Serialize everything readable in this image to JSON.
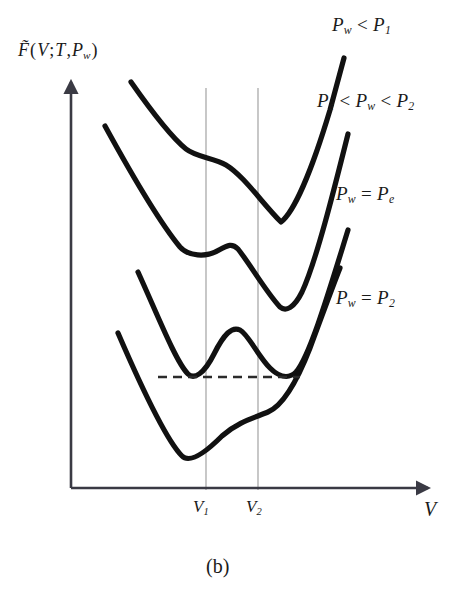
{
  "figure": {
    "caption": "(b)",
    "axes": {
      "y_label": "F̃(V;T,P_w)",
      "y_label_parts": {
        "tilde_f": "F̃",
        "open": "(",
        "v": "V",
        "semicolon": ";",
        "t": "T",
        "comma": ",",
        "p": "P",
        "p_sub": "w",
        "close": ")"
      },
      "x_label": "V",
      "x_ticks": [
        {
          "label_base": "V",
          "label_sub": "1",
          "label": "V₁",
          "x_px": 206
        },
        {
          "label_base": "V",
          "label_sub": "2",
          "label": "V₂",
          "x_px": 258
        }
      ],
      "origin_px": {
        "x": 71,
        "y": 488
      },
      "y_axis_top_px": 80,
      "x_axis_right_px": 430,
      "axis_color": "#3a3a44",
      "gridline_color": "#9a9a9a"
    },
    "curve_labels": [
      {
        "id": "lab0",
        "text": "P_w < P_1",
        "p1": "P",
        "p1_sub": "w",
        "op": "<",
        "p2": "P",
        "p2_sub": "1"
      },
      {
        "id": "lab1",
        "text": "P_e < P_w < P_2",
        "p1": "P",
        "p1_sub": "e",
        "op": "<",
        "p2": "P",
        "p2_sub": "w",
        "op2": "<",
        "p3": "P",
        "p3_sub": "2"
      },
      {
        "id": "lab2",
        "text": "P_w = P_e",
        "p1": "P",
        "p1_sub": "w",
        "op": "=",
        "p2": "P",
        "p2_sub": "e"
      },
      {
        "id": "lab3",
        "text": "P_w = P_2",
        "p1": "P",
        "p1_sub": "w",
        "op": "=",
        "p2": "P",
        "p2_sub": "2"
      }
    ],
    "curve_color": "#111111",
    "curve_width": 5.2,
    "tie_line": {
      "y_px": 377,
      "x_start_px": 158,
      "x_end_px": 300,
      "style": "dashed",
      "color": "#2b2b2b"
    }
  },
  "chart_data": {
    "type": "line",
    "title": "",
    "xlabel": "V",
    "ylabel": "F̃(V;T,P_w)",
    "grid": true,
    "legend": "inline-right",
    "annotations": [
      "(b)",
      "Maxwell equal-depth tie line at P_w = P_e"
    ],
    "x_tick_values": [
      "V1",
      "V2"
    ],
    "series": [
      {
        "name": "P_w < P_1",
        "shape": "monotonic descent with inflection shoulder near V1, single minimum right of V2",
        "minima": [
          {
            "x_px": 281,
            "y_px": 222,
            "type": "global"
          }
        ],
        "inflection": [
          {
            "x_px": 212,
            "y_px": 155
          }
        ],
        "points_px": [
          [
            131,
            82
          ],
          [
            150,
            104
          ],
          [
            168,
            128
          ],
          [
            182,
            145
          ],
          [
            193,
            152
          ],
          [
            205,
            155
          ],
          [
            222,
            158
          ],
          [
            238,
            170
          ],
          [
            252,
            188
          ],
          [
            264,
            206
          ],
          [
            274,
            218
          ],
          [
            281,
            222
          ],
          [
            291,
            214
          ],
          [
            303,
            188
          ],
          [
            318,
            146
          ],
          [
            333,
            98
          ],
          [
            344,
            58
          ]
        ]
      },
      {
        "name": "P_e < P_w < P_2",
        "shape": "shallow local minimum left of V1, low bump, deep global minimum right of V2",
        "minima": [
          {
            "x_px": 196,
            "y_px": 258,
            "type": "local"
          },
          {
            "x_px": 285,
            "y_px": 310,
            "type": "global"
          }
        ],
        "maxima": [
          {
            "x_px": 233,
            "y_px": 244
          }
        ],
        "points_px": [
          [
            105,
            126
          ],
          [
            125,
            160
          ],
          [
            145,
            196
          ],
          [
            165,
            226
          ],
          [
            180,
            247
          ],
          [
            196,
            258
          ],
          [
            212,
            255
          ],
          [
            226,
            246
          ],
          [
            233,
            244
          ],
          [
            243,
            252
          ],
          [
            255,
            272
          ],
          [
            268,
            293
          ],
          [
            278,
            306
          ],
          [
            287,
            310
          ],
          [
            297,
            300
          ],
          [
            309,
            272
          ],
          [
            322,
            230
          ],
          [
            336,
            180
          ],
          [
            348,
            134
          ]
        ]
      },
      {
        "name": "P_w = P_e",
        "shape": "double well with two equal-depth minima straddling V1 and V2, central barrier",
        "minima": [
          {
            "x_px": 192,
            "y_px": 377,
            "type": "global"
          },
          {
            "x_px": 289,
            "y_px": 377,
            "type": "global"
          }
        ],
        "maxima": [
          {
            "x_px": 238,
            "y_px": 328
          }
        ],
        "tie_line_y_px": 377,
        "points_px": [
          [
            138,
            272
          ],
          [
            152,
            302
          ],
          [
            166,
            333
          ],
          [
            178,
            358
          ],
          [
            186,
            372
          ],
          [
            192,
            377
          ],
          [
            203,
            372
          ],
          [
            215,
            352
          ],
          [
            228,
            333
          ],
          [
            238,
            328
          ],
          [
            248,
            336
          ],
          [
            260,
            354
          ],
          [
            272,
            369
          ],
          [
            282,
            376
          ],
          [
            289,
            377
          ],
          [
            297,
            370
          ],
          [
            308,
            348
          ],
          [
            322,
            310
          ],
          [
            336,
            266
          ],
          [
            348,
            230
          ]
        ]
      },
      {
        "name": "P_w = P_2",
        "shape": "single deep minimum left of V1, rising shoulder/inflection near V2, steep rise after",
        "minima": [
          {
            "x_px": 186,
            "y_px": 458,
            "type": "global"
          }
        ],
        "inflection": [
          {
            "x_px": 264,
            "y_px": 414
          }
        ],
        "points_px": [
          [
            118,
            333
          ],
          [
            134,
            370
          ],
          [
            150,
            408
          ],
          [
            165,
            436
          ],
          [
            176,
            452
          ],
          [
            186,
            458
          ],
          [
            198,
            452
          ],
          [
            212,
            438
          ],
          [
            228,
            428
          ],
          [
            244,
            420
          ],
          [
            258,
            415
          ],
          [
            268,
            412
          ],
          [
            280,
            404
          ],
          [
            292,
            386
          ],
          [
            305,
            356
          ],
          [
            318,
            320
          ],
          [
            330,
            290
          ],
          [
            340,
            268
          ]
        ]
      }
    ]
  }
}
